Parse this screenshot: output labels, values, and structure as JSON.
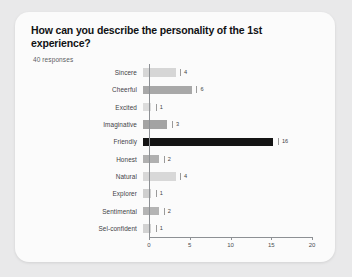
{
  "card": {
    "title": "How can you describe the personality of the 1st experience?",
    "subtitle": "40 responses"
  },
  "chart_data": {
    "type": "bar",
    "orientation": "horizontal",
    "title": "How can you describe the personality of the 1st experience?",
    "subtitle": "40 responses",
    "xlabel": "",
    "ylabel": "",
    "xlim": [
      0,
      20
    ],
    "xticks": [
      0,
      5,
      10,
      15,
      20
    ],
    "grid": false,
    "legend": false,
    "categories": [
      "Sincere",
      "Cheerful",
      "Excited",
      "Imaginative",
      "Friendly",
      "Honest",
      "Natural",
      "Explorer",
      "Sentimental",
      "Sel-confident"
    ],
    "values": [
      4,
      6,
      1,
      3,
      16,
      2,
      4,
      1,
      2,
      1
    ],
    "bar_colors": [
      "#d6d6d6",
      "#a8a8a8",
      "#dcdcdc",
      "#a3a3a3",
      "#141414",
      "#b0b0b0",
      "#d8d8d8",
      "#cfcfcf",
      "#b4b4b4",
      "#d2d2d2"
    ]
  },
  "axis": {
    "ticks": [
      "0",
      "5",
      "10",
      "15",
      "20"
    ]
  },
  "colors": {
    "page_background": "#e9e9ea",
    "card_background": "#fbfbfb",
    "axis": "#8d9094",
    "text": "#3f4246",
    "title": "#111214"
  }
}
